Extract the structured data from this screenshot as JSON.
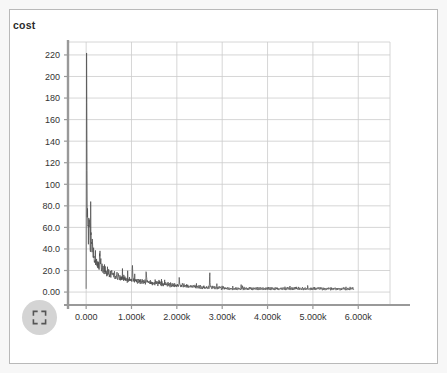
{
  "window": {
    "background_color": "#f7f7f7",
    "card_background": "#ffffff",
    "card_border_color": "#b9b9b9"
  },
  "controls": {
    "fullscreen_button": {
      "icon": "fullscreen-expand-icon",
      "label": "",
      "background_color": "#d4d4d4",
      "icon_color": "#555555"
    }
  },
  "chart_data": {
    "type": "line",
    "title": "cost",
    "xlabel": "",
    "ylabel": "",
    "legend": [],
    "legend_position": "none",
    "grid": true,
    "grid_color": "#cccccc",
    "axis_color": "#999999",
    "line_color": "#4d4d4d",
    "xlim": [
      -400,
      6700
    ],
    "ylim": [
      -12,
      232
    ],
    "x_ticks": [
      0,
      1000,
      2000,
      3000,
      4000,
      5000,
      6000
    ],
    "x_tick_labels": [
      "0.000",
      "1.000k",
      "2.000k",
      "3.000k",
      "4.000k",
      "5.000k",
      "6.000k"
    ],
    "y_ticks": [
      0,
      20,
      40,
      60,
      80,
      100,
      120,
      140,
      160,
      180,
      200,
      220
    ],
    "y_tick_labels": [
      "0.00",
      "20.0",
      "40.0",
      "60.0",
      "80.0",
      "100",
      "120",
      "140",
      "160",
      "180",
      "200",
      "220"
    ],
    "series": [
      {
        "name": "cost",
        "color": "#4d4d4d",
        "description": "Training cost per step: initial spike to ~222 then rapid noisy decay toward ~2",
        "x_start": 0,
        "x_end": 5900,
        "x_step": 10,
        "values": [
          3,
          222,
          96,
          70,
          58,
          52,
          64,
          80,
          61,
          47,
          44,
          52,
          41,
          37,
          44,
          39,
          33,
          36,
          31,
          30,
          34,
          29,
          27,
          31,
          26,
          24,
          28,
          25,
          22,
          26,
          40,
          35,
          28,
          24,
          22,
          27,
          23,
          20,
          24,
          21,
          19,
          23,
          20,
          18,
          22,
          19,
          17,
          21,
          18,
          16,
          20,
          17,
          15,
          19,
          16,
          15,
          18,
          16,
          14,
          17,
          15,
          14,
          17,
          15,
          13,
          16,
          14,
          13,
          16,
          14,
          12,
          15,
          13,
          12,
          15,
          13,
          12,
          14,
          13,
          11,
          14,
          12,
          11,
          14,
          12,
          11,
          13,
          12,
          10,
          13,
          11,
          10,
          13,
          11,
          10,
          12,
          11,
          10,
          12,
          11,
          10,
          12,
          29,
          14,
          10,
          12,
          11,
          9,
          12,
          10,
          9,
          11,
          10,
          9,
          11,
          10,
          9,
          11,
          10,
          8,
          11,
          9,
          8,
          11,
          9,
          8,
          10,
          9,
          8,
          10,
          9,
          8,
          20,
          12,
          9,
          10,
          9,
          8,
          10,
          9,
          7,
          10,
          9,
          7,
          10,
          8,
          7,
          9,
          8,
          7,
          9,
          8,
          7,
          9,
          8,
          7,
          9,
          8,
          6,
          9,
          8,
          6,
          9,
          8,
          6,
          8,
          7,
          6,
          8,
          7,
          6,
          8,
          7,
          6,
          8,
          7,
          6,
          8,
          7,
          6,
          8,
          7,
          5,
          8,
          7,
          5,
          8,
          7,
          5,
          7,
          6,
          5,
          7,
          6,
          5,
          7,
          6,
          5,
          7,
          6,
          5,
          7,
          6,
          5,
          7,
          13,
          7,
          6,
          5,
          7,
          6,
          5,
          7,
          6,
          5,
          7,
          6,
          4,
          7,
          6,
          4,
          6,
          6,
          4,
          6,
          5,
          4,
          6,
          5,
          4,
          6,
          5,
          4,
          6,
          5,
          4,
          6,
          5,
          4,
          6,
          5,
          4,
          6,
          5,
          4,
          6,
          5,
          4,
          6,
          5,
          3,
          6,
          5,
          3,
          6,
          5,
          3,
          5,
          5,
          3,
          5,
          4,
          3,
          5,
          4,
          3,
          5,
          4,
          3,
          5,
          4,
          3,
          17,
          8,
          4,
          5,
          4,
          3,
          5,
          4,
          3,
          5,
          4,
          3,
          5,
          4,
          3,
          5,
          4,
          3,
          5,
          4,
          3,
          5,
          4,
          3,
          5,
          4,
          2,
          5,
          4,
          2,
          5,
          4,
          2,
          4,
          4,
          2,
          4,
          3,
          2,
          4,
          3,
          2,
          4,
          3,
          2,
          4,
          3,
          2,
          4,
          3,
          2,
          4,
          3,
          2,
          4,
          3,
          2,
          4,
          3,
          2,
          4,
          3,
          2,
          4,
          3,
          2,
          4,
          3,
          2,
          4,
          3,
          2,
          4,
          3,
          2,
          4,
          3,
          2,
          4,
          3,
          2,
          4,
          3,
          2,
          4,
          3,
          2,
          4,
          3,
          2,
          4,
          3,
          2,
          4,
          3,
          2,
          4,
          3,
          2,
          4,
          3,
          2,
          4,
          3,
          2,
          4,
          3,
          2,
          4,
          3,
          2,
          4,
          3,
          2,
          4,
          3,
          2,
          4,
          3,
          2,
          4,
          3,
          2,
          4,
          3,
          2,
          4,
          3,
          2,
          4,
          3,
          2,
          4,
          3,
          2,
          4,
          3,
          2,
          4,
          3,
          2,
          4,
          3,
          2,
          4,
          3,
          2,
          4,
          3,
          2,
          4,
          3,
          2,
          4,
          3,
          2,
          4,
          3,
          2,
          4,
          3,
          2,
          4,
          3,
          2,
          4,
          3,
          2,
          4,
          3,
          2,
          4,
          3,
          2,
          4,
          3,
          2,
          4,
          3,
          2,
          4,
          3,
          2,
          4,
          3,
          2,
          4,
          3,
          2,
          4,
          3,
          2,
          4,
          3,
          2,
          4,
          3,
          2,
          4,
          3,
          2,
          4,
          3,
          2,
          4,
          3,
          2,
          4,
          3,
          2,
          4,
          3,
          2,
          4,
          3,
          2,
          4,
          3,
          2,
          4,
          3,
          2,
          4,
          3,
          2,
          4,
          3,
          2,
          4,
          3,
          2,
          4,
          3,
          2,
          4,
          3,
          2,
          4,
          3,
          2,
          4,
          3,
          2,
          4,
          3,
          2,
          4,
          3,
          2,
          4,
          3,
          2,
          4,
          3,
          2,
          4,
          3,
          2,
          4,
          3,
          2,
          4,
          3,
          2,
          4,
          3,
          2,
          4,
          3,
          2,
          4,
          3,
          2,
          4,
          3,
          2,
          4,
          3,
          2,
          4,
          3,
          2,
          4,
          3,
          2,
          4,
          3,
          2,
          4,
          3,
          2,
          4,
          3,
          2,
          4,
          3,
          2,
          4,
          3,
          2,
          4,
          3,
          2,
          4,
          3,
          2,
          4,
          3,
          2,
          4,
          3,
          2,
          4,
          3,
          2,
          4,
          3,
          2
        ]
      }
    ]
  }
}
